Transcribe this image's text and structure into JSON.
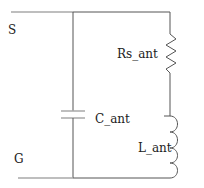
{
  "diagram": {
    "type": "circuit-schematic",
    "nodes": {
      "source": "S",
      "ground": "G"
    },
    "components": [
      {
        "id": "capacitor",
        "label": "C_ant",
        "kind": "capacitor"
      },
      {
        "id": "resistor",
        "label": "Rs_ant",
        "kind": "resistor"
      },
      {
        "id": "inductor",
        "label": "L_ant",
        "kind": "inductor"
      }
    ],
    "colors": {
      "wire": "#555555",
      "text": "#222222"
    }
  }
}
